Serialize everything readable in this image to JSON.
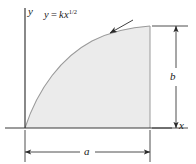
{
  "figure": {
    "kind": "shaded-area-under-curve-diagram",
    "background_color": "#ffffff",
    "line_color": "#3a3a3a",
    "curve_color": "#8a8a8a",
    "fill_color": "#ebebeb",
    "fill_stroke_color": "#9a9a9a"
  },
  "axes": {
    "y_label": "y",
    "x_label": "x",
    "origin": {
      "x": 25,
      "y": 128
    },
    "y_axis": {
      "x": 25,
      "top": 8,
      "bottom": 128
    },
    "x_axis": {
      "y": 128,
      "left": 5,
      "right": 172
    }
  },
  "curve": {
    "equation_lhs": "y",
    "equation_operator": "=",
    "equation_coefficient": "k",
    "equation_variable": "x",
    "equation_exponent": "1/2",
    "equation_plain": "y = kx^1/2",
    "start_point": {
      "x": 25,
      "y": 128
    },
    "end_point": {
      "x": 150,
      "y": 26
    },
    "shape": "square-root",
    "leader_line": {
      "from_x": 133,
      "from_y": 20,
      "to_x": 110,
      "to_y": 33
    }
  },
  "region": {
    "right_edge_x": 150,
    "top_y": 26,
    "bottom_y": 128,
    "left_x": 25
  },
  "dimensions": {
    "vertical": {
      "label": "b",
      "line_x": 176,
      "top_y": 26,
      "bottom_y": 128,
      "extension_top": {
        "x1": 152,
        "x2": 188,
        "y": 26
      },
      "extension_bottom": {
        "x1": 152,
        "x2": 188,
        "y": 128
      }
    },
    "horizontal": {
      "label": "a",
      "line_y": 152,
      "left_x": 25,
      "right_x": 150,
      "extension_left": {
        "x": 25,
        "y1": 130,
        "y2": 162
      },
      "extension_right": {
        "x": 150,
        "y1": 130,
        "y2": 162
      }
    }
  }
}
